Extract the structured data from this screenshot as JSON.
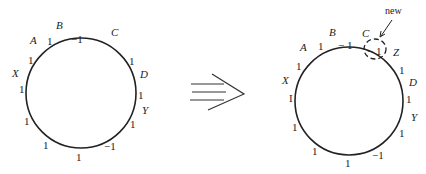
{
  "left_diagram": {
    "circle": {
      "cx": 81,
      "cy": 93,
      "r": 55
    },
    "labels": [
      {
        "text": "B",
        "x": 56,
        "y": 29,
        "italic": true
      },
      {
        "text": "−1",
        "x": 71,
        "y": 43,
        "italic": false
      },
      {
        "text": "C",
        "x": 111,
        "y": 36,
        "italic": true
      },
      {
        "text": "A",
        "x": 30,
        "y": 44,
        "italic": true
      },
      {
        "text": "1",
        "x": 47,
        "y": 45,
        "italic": false
      },
      {
        "text": "1",
        "x": 28,
        "y": 64,
        "italic": false
      },
      {
        "text": "X",
        "x": 12,
        "y": 77,
        "italic": true
      },
      {
        "text": "1",
        "x": 19,
        "y": 93,
        "italic": false
      },
      {
        "text": "1",
        "x": 24,
        "y": 125,
        "italic": false
      },
      {
        "text": "1",
        "x": 43,
        "y": 149,
        "italic": false
      },
      {
        "text": "1",
        "x": 76,
        "y": 161,
        "italic": false
      },
      {
        "text": "−1",
        "x": 104,
        "y": 150,
        "italic": false
      },
      {
        "text": "1",
        "x": 129,
        "y": 65,
        "italic": false
      },
      {
        "text": "D",
        "x": 140,
        "y": 78,
        "italic": true
      },
      {
        "text": "1",
        "x": 138,
        "y": 99,
        "italic": false
      },
      {
        "text": "Y",
        "x": 142,
        "y": 114,
        "italic": true
      },
      {
        "text": "1",
        "x": 130,
        "y": 128,
        "italic": false
      }
    ]
  },
  "arrow": {
    "symbol": "implies-arrow"
  },
  "right_diagram": {
    "circle": {
      "cx": 349,
      "cy": 101,
      "r": 54
    },
    "annotation": {
      "text": "new"
    },
    "labels": [
      {
        "text": "B",
        "x": 329,
        "y": 36,
        "italic": true
      },
      {
        "text": "− 1",
        "x": 338,
        "y": 49,
        "italic": false
      },
      {
        "text": "C",
        "x": 362,
        "y": 37,
        "italic": true
      },
      {
        "text": "− 1",
        "x": 367,
        "y": 55,
        "italic": false
      },
      {
        "text": "Z",
        "x": 393,
        "y": 56,
        "italic": true
      },
      {
        "text": "A",
        "x": 300,
        "y": 51,
        "italic": true
      },
      {
        "text": "1",
        "x": 318,
        "y": 50,
        "italic": false
      },
      {
        "text": "1",
        "x": 296,
        "y": 70,
        "italic": false
      },
      {
        "text": "X",
        "x": 282,
        "y": 84,
        "italic": true
      },
      {
        "text": "I",
        "x": 289,
        "y": 102,
        "italic": false
      },
      {
        "text": "1",
        "x": 292,
        "y": 131,
        "italic": false
      },
      {
        "text": "1",
        "x": 312,
        "y": 155,
        "italic": false
      },
      {
        "text": "1",
        "x": 345,
        "y": 167,
        "italic": false
      },
      {
        "text": "−1",
        "x": 372,
        "y": 159,
        "italic": false
      },
      {
        "text": "1",
        "x": 399,
        "y": 74,
        "italic": false
      },
      {
        "text": "D",
        "x": 409,
        "y": 86,
        "italic": true
      },
      {
        "text": "1",
        "x": 406,
        "y": 103,
        "italic": false
      },
      {
        "text": "Y",
        "x": 411,
        "y": 121,
        "italic": true
      },
      {
        "text": "1",
        "x": 399,
        "y": 137,
        "italic": false
      }
    ]
  }
}
